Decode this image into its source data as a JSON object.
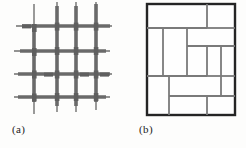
{
  "page": {
    "background_color": "#fdfdfc",
    "width": 246,
    "height": 148
  },
  "figures": [
    {
      "id": "figure-a",
      "caption": "(a)",
      "kind": "woven-wire-mesh-grid",
      "description": "Square grid of crossing gray wires with overlapping woven segments and ends extending past the outer crossings",
      "line_color": "#6f6f6f",
      "thick_line_color": "#6a6a6a",
      "thin_stroke_width": 1.4,
      "thick_stroke_width": 3.6,
      "vertical_lines": [
        {
          "x": 20,
          "y1": 2,
          "y2": 112
        },
        {
          "x": 43,
          "y1": 0,
          "y2": 110
        },
        {
          "x": 62,
          "y1": 0,
          "y2": 110
        },
        {
          "x": 82,
          "y1": 0,
          "y2": 108
        }
      ],
      "horizontal_lines": [
        {
          "y": 24,
          "x1": 2,
          "x2": 98
        },
        {
          "y": 49,
          "x1": 0,
          "x2": 96
        },
        {
          "y": 72,
          "x1": 0,
          "x2": 98
        },
        {
          "y": 95,
          "x1": 0,
          "x2": 96
        }
      ],
      "thick_horizontal_segments": [
        {
          "y": 24,
          "x1": 8,
          "x2": 96
        },
        {
          "y": 49,
          "x1": 6,
          "x2": 92
        },
        {
          "y": 72,
          "x1": 4,
          "x2": 96
        },
        {
          "y": 95,
          "x1": 4,
          "x2": 92
        }
      ],
      "thick_vertical_segments": [
        {
          "x": 43,
          "y1": 4,
          "y2": 104
        },
        {
          "x": 62,
          "y1": 4,
          "y2": 104
        },
        {
          "x": 20,
          "y1": 26,
          "y2": 100
        },
        {
          "x": 82,
          "y1": 2,
          "y2": 100
        }
      ]
    },
    {
      "id": "figure-b",
      "caption": "(b)",
      "kind": "rectangular-partition",
      "description": "Dark bordered square subdivided by gray lines into irregular rectangular cells (brick / pinwheel tiling)",
      "border_color": "#242424",
      "border_width": 2.4,
      "inner_line_color": "#7a7a7a",
      "inner_line_width": 1.8,
      "frame": {
        "x": 2,
        "y": 2,
        "width": 88,
        "height": 111
      },
      "inner_horizontal_lines": [
        {
          "y": 26,
          "x1": 2,
          "x2": 62
        },
        {
          "y": 26,
          "x1": 62,
          "x2": 90
        },
        {
          "y": 44,
          "x1": 42,
          "x2": 90
        },
        {
          "y": 74,
          "x1": 2,
          "x2": 62
        },
        {
          "y": 74,
          "x1": 62,
          "x2": 90
        },
        {
          "y": 94,
          "x1": 24,
          "x2": 90
        }
      ],
      "inner_vertical_lines": [
        {
          "x": 62,
          "y1": 2,
          "y2": 26
        },
        {
          "x": 18,
          "y1": 26,
          "y2": 74
        },
        {
          "x": 42,
          "y1": 26,
          "y2": 74
        },
        {
          "x": 76,
          "y1": 44,
          "y2": 94
        },
        {
          "x": 62,
          "y1": 44,
          "y2": 74
        },
        {
          "x": 24,
          "y1": 74,
          "y2": 113
        },
        {
          "x": 62,
          "y1": 94,
          "y2": 113
        }
      ]
    }
  ]
}
